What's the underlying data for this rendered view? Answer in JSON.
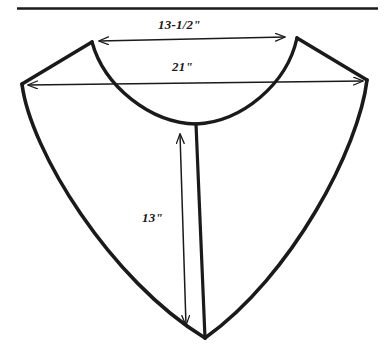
{
  "figure": {
    "background_color": "#ffffff",
    "ink_color": "#1a1a1a",
    "rule": {
      "name": "top-horizontal-rule",
      "x1": 17,
      "y1": 8,
      "x2": 378,
      "y2": 8,
      "thickness": 2.6
    }
  },
  "dimensions": [
    {
      "id": "shoulder-width",
      "label": "13-1/2\"",
      "orientation": "horizontal",
      "value": 13.5,
      "unit": "inch",
      "arrowheads": "both",
      "from": [
        99,
        41
      ],
      "to": [
        285,
        37
      ]
    },
    {
      "id": "chest-width",
      "label": "21\"",
      "orientation": "horizontal",
      "value": 21,
      "unit": "inch",
      "arrowheads": "both",
      "from": [
        28,
        85
      ],
      "to": [
        363,
        81
      ]
    },
    {
      "id": "center-front-length",
      "label": "13\"",
      "orientation": "vertical",
      "value": 13,
      "unit": "inch",
      "arrowheads": "both",
      "from": [
        180,
        134
      ],
      "to": [
        186,
        325
      ]
    }
  ],
  "outline": {
    "name": "collar-outline",
    "stroke_width": 3.4,
    "points": {
      "left_shoulder_point": [
        92,
        42
      ],
      "right_shoulder_point": [
        297,
        38
      ],
      "left_corner": [
        22,
        84
      ],
      "right_corner": [
        367,
        80
      ],
      "bottom_point": [
        205,
        338
      ],
      "neck_bottom": [
        196,
        124
      ]
    }
  },
  "center_line": {
    "name": "center-front-line",
    "from": [
      196,
      124
    ],
    "to": [
      205,
      338
    ],
    "stroke_width": 3.2
  }
}
